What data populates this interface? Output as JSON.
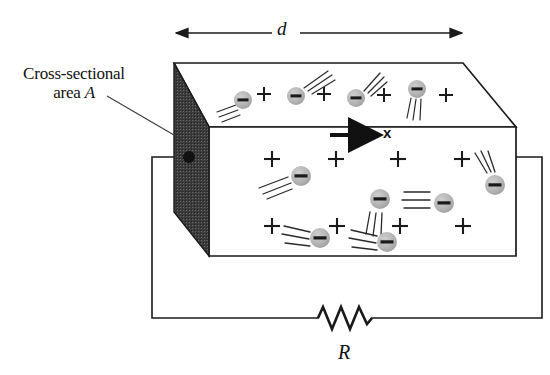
{
  "figure": {
    "labels": {
      "cross_section_line1": "Cross-sectional",
      "cross_section_line2_prefix": "area ",
      "cross_section_line2_symbol": "A",
      "length_symbol": "d",
      "axis_symbol": "x",
      "resistor_symbol": "R"
    },
    "colors": {
      "outline": "#1a1a1a",
      "end_face_fill": "#3c3c3c",
      "electron_fill": "#b5b5b5",
      "electron_bar": "#1a1a1a",
      "background": "#ffffff",
      "wire": "#1a1a1a",
      "terminal_dot": "#111111"
    },
    "geometry": {
      "box": {
        "front_face": [
          [
            209,
            127
          ],
          [
            516,
            127
          ],
          [
            516,
            256
          ],
          [
            209,
            256
          ]
        ],
        "top_back_left": [
          174,
          63
        ],
        "top_back_right": [
          463,
          63
        ],
        "top_bevel_to": [
          516,
          127
        ],
        "end_face": [
          [
            174,
            63
          ],
          [
            209,
            127
          ],
          [
            209,
            256
          ],
          [
            174,
            212
          ]
        ]
      },
      "dimension_arrow": {
        "x1": 176,
        "x2": 462,
        "y": 33
      },
      "direction_arrow": {
        "x1": 330,
        "x2": 376,
        "y": 135
      },
      "wire": {
        "terminal": [
          189,
          157
        ],
        "left_path": [
          [
            189,
            157
          ],
          [
            152,
            157
          ],
          [
            152,
            318
          ],
          [
            318,
            318
          ]
        ],
        "right_path": [
          [
            516,
            157
          ],
          [
            542,
            157
          ],
          [
            542,
            318
          ],
          [
            372,
            318
          ]
        ]
      },
      "resistor": {
        "x_start": 318,
        "x_end": 372,
        "y": 318,
        "peaks": 3,
        "amplitude": 11
      }
    },
    "particles": {
      "top_face": {
        "electrons": [
          {
            "x": 243,
            "y": 100,
            "r": 9,
            "trails": [
              [
                -26,
                12
              ],
              [
                -24,
                17
              ],
              [
                -22,
                22
              ]
            ]
          },
          {
            "x": 296,
            "y": 96,
            "r": 9,
            "trails": [
              [
                28,
                -18
              ],
              [
                32,
                -13
              ],
              [
                35,
                -8
              ]
            ]
          },
          {
            "x": 356,
            "y": 98,
            "r": 9,
            "trails": [
              [
                20,
                -20
              ],
              [
                24,
                -16
              ],
              [
                27,
                -11
              ]
            ]
          },
          {
            "x": 417,
            "y": 89,
            "r": 9,
            "trails": [
              [
                -8,
                26
              ],
              [
                -3,
                29
              ],
              [
                2,
                30
              ]
            ]
          }
        ],
        "plus_signs": [
          {
            "x": 264,
            "y": 94
          },
          {
            "x": 324,
            "y": 94
          },
          {
            "x": 384,
            "y": 95
          },
          {
            "x": 446,
            "y": 95
          }
        ]
      },
      "front_face": {
        "electrons": [
          {
            "x": 301,
            "y": 176,
            "r": 10,
            "trails": [
              [
                -34,
                14
              ],
              [
                -30,
                19
              ],
              [
                -25,
                24
              ]
            ]
          },
          {
            "x": 380,
            "y": 199,
            "r": 10,
            "trails": [
              [
                -8,
                30
              ],
              [
                -3,
                32
              ],
              [
                2,
                33
              ]
            ]
          },
          {
            "x": 444,
            "y": 203,
            "r": 10,
            "trails": [
              [
                -34,
                -6
              ],
              [
                -32,
                0
              ],
              [
                -30,
                6
              ]
            ]
          },
          {
            "x": 495,
            "y": 185,
            "r": 10,
            "trails": [
              [
                -16,
                -26
              ],
              [
                -11,
                -28
              ],
              [
                -5,
                -29
              ]
            ]
          },
          {
            "x": 320,
            "y": 238,
            "r": 10,
            "trails": [
              [
                -32,
                -10
              ],
              [
                -30,
                -4
              ],
              [
                -28,
                3
              ]
            ]
          },
          {
            "x": 387,
            "y": 242,
            "r": 10,
            "trails": [
              [
                -32,
                -12
              ],
              [
                -30,
                -5
              ],
              [
                -28,
                2
              ]
            ]
          }
        ],
        "plus_signs": [
          {
            "x": 272,
            "y": 159
          },
          {
            "x": 336,
            "y": 159
          },
          {
            "x": 398,
            "y": 159
          },
          {
            "x": 462,
            "y": 159
          },
          {
            "x": 272,
            "y": 226
          },
          {
            "x": 337,
            "y": 226
          },
          {
            "x": 400,
            "y": 226
          },
          {
            "x": 463,
            "y": 226
          }
        ]
      }
    },
    "leader_line": {
      "x1": 107,
      "y1": 96,
      "x2": 186,
      "y2": 142
    }
  }
}
